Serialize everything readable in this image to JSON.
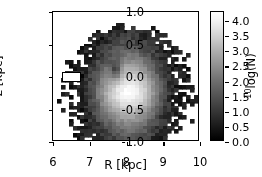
{
  "figure": {
    "kind": "2d-histogram-grayscale"
  },
  "chart_data": {
    "type": "heatmap",
    "title": "",
    "xlabel": "R [kpc]",
    "ylabel": "z [kpc]",
    "xlim": [
      6.0,
      10.0
    ],
    "ylim": [
      -1.0,
      1.0
    ],
    "xticks": [
      "6",
      "7",
      "8",
      "9",
      "10"
    ],
    "xtick_values": [
      6,
      7,
      8,
      9,
      10
    ],
    "yticks": [
      "1.0",
      "0.5",
      "0.0",
      "-0.5",
      "-1.0"
    ],
    "ytick_values": [
      1.0,
      0.5,
      0.0,
      -0.5,
      -1.0
    ],
    "grid": false,
    "colormap": "gray",
    "nx": 37,
    "ny": 37,
    "cell_dx": 0.108,
    "cell_dz": 0.054,
    "zlim": [
      0.0,
      4.3
    ],
    "empty_cell_color": "#ffffff",
    "peak": {
      "R": 8.1,
      "z": -0.25,
      "value": 4.3
    },
    "annotation_rect": {
      "name": "solar-neighborhood-box",
      "R_min": 6.25,
      "R_max": 6.75,
      "z_min": -0.07,
      "z_max": 0.07,
      "facecolor": "#ffffff",
      "edgecolor": "#000000"
    },
    "colorbar": {
      "label": "log(N)",
      "label_prefix": "10",
      "position": "right",
      "orientation": "vertical",
      "ticks": [
        "0.0",
        "0.5",
        "1.0",
        "1.5",
        "2.0",
        "2.5",
        "3.0",
        "3.5",
        "4.0"
      ],
      "tick_values": [
        0.0,
        0.5,
        1.0,
        1.5,
        2.0,
        2.5,
        3.0,
        3.5,
        4.0
      ],
      "vmin": 0.0,
      "vmax": 4.3
    },
    "radial_profile_at_midplane": {
      "R": [
        6.0,
        6.2,
        6.4,
        6.6,
        6.8,
        7.0,
        7.2,
        7.4,
        7.6,
        7.8,
        8.0,
        8.2,
        8.4,
        8.6,
        8.8,
        9.0,
        9.2,
        9.4,
        9.6,
        9.8,
        10.0
      ],
      "log10N": [
        0.2,
        0.3,
        0.4,
        0.6,
        0.9,
        1.4,
        2.1,
        3.0,
        3.8,
        4.2,
        4.3,
        4.3,
        4.1,
        3.6,
        2.7,
        1.8,
        1.1,
        0.7,
        0.5,
        0.3,
        0.2
      ]
    },
    "vertical_profile_at_R8": {
      "z": [
        -1.0,
        -0.9,
        -0.8,
        -0.7,
        -0.6,
        -0.5,
        -0.4,
        -0.3,
        -0.2,
        -0.1,
        0.0,
        0.1,
        0.2,
        0.3,
        0.4,
        0.5,
        0.6,
        0.7,
        0.8,
        0.9,
        1.0
      ],
      "log10N": [
        1.5,
        1.8,
        2.2,
        2.6,
        3.1,
        3.7,
        4.1,
        4.3,
        4.3,
        4.2,
        4.1,
        4.0,
        3.9,
        3.6,
        3.2,
        2.7,
        2.2,
        1.8,
        1.4,
        1.1,
        0.9
      ]
    }
  }
}
